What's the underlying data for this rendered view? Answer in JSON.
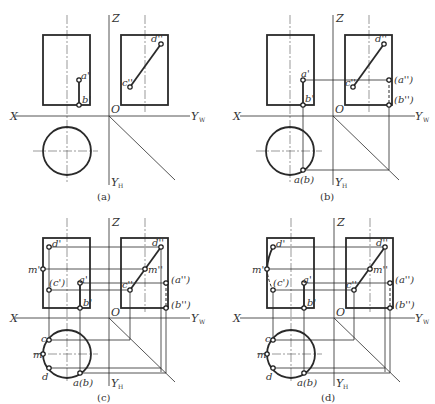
{
  "figure": {
    "panels": [
      {
        "id": "a",
        "caption": "(a)"
      },
      {
        "id": "b",
        "caption": "(b)"
      },
      {
        "id": "c",
        "caption": "(c)"
      },
      {
        "id": "d",
        "caption": "(d)"
      }
    ],
    "axes": {
      "z": "Z",
      "x": "X",
      "origin": "O",
      "yw": "Y",
      "yw_sub": "W",
      "yh": "Y",
      "yh_sub": "H"
    },
    "points": {
      "a_front": "a'",
      "b_front": "b'",
      "c_front_hidden": "(c')",
      "d_front": "d'",
      "m_front": "m'",
      "c_side": "c''",
      "d_side": "d''",
      "m_side": "m''",
      "a_side_hidden": "(a'')",
      "b_side_hidden": "(b'')",
      "ab_top": "a(b)",
      "c_top": "c",
      "d_top": "d",
      "m_top": "m"
    }
  }
}
